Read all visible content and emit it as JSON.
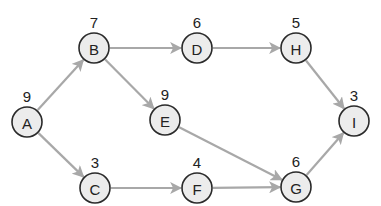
{
  "diagram": {
    "type": "network-graph",
    "style": {
      "node_fill": "#ececec",
      "node_stroke": "#2a2a2a",
      "edge_color": "#a8a8a8",
      "text_color": "#222222"
    },
    "nodes": [
      {
        "id": "A",
        "label": "A",
        "weight": "9",
        "x": 27,
        "y": 122
      },
      {
        "id": "B",
        "label": "B",
        "weight": "7",
        "x": 94,
        "y": 48
      },
      {
        "id": "C",
        "label": "C",
        "weight": "3",
        "x": 95,
        "y": 188
      },
      {
        "id": "D",
        "label": "D",
        "weight": "6",
        "x": 197,
        "y": 48
      },
      {
        "id": "E",
        "label": "E",
        "weight": "9",
        "x": 165,
        "y": 120
      },
      {
        "id": "F",
        "label": "F",
        "weight": "4",
        "x": 197,
        "y": 188
      },
      {
        "id": "G",
        "label": "G",
        "weight": "6",
        "x": 296,
        "y": 187
      },
      {
        "id": "H",
        "label": "H",
        "weight": "5",
        "x": 296,
        "y": 48
      },
      {
        "id": "I",
        "label": "I",
        "weight": "3",
        "x": 354,
        "y": 121
      }
    ],
    "edges": [
      {
        "from": "A",
        "to": "B"
      },
      {
        "from": "A",
        "to": "C"
      },
      {
        "from": "B",
        "to": "D"
      },
      {
        "from": "B",
        "to": "E"
      },
      {
        "from": "D",
        "to": "H"
      },
      {
        "from": "E",
        "to": "G"
      },
      {
        "from": "C",
        "to": "F"
      },
      {
        "from": "F",
        "to": "G"
      },
      {
        "from": "H",
        "to": "I"
      },
      {
        "from": "G",
        "to": "I"
      }
    ]
  }
}
